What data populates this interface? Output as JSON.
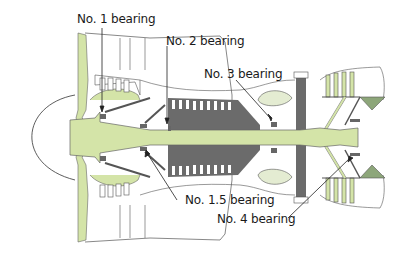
{
  "diagram": {
    "colors": {
      "rotor_green": "#d4e4a8",
      "compressor_gray": "#6b6b6b",
      "outline": "#333333",
      "background": "#ffffff"
    },
    "labels": [
      {
        "id": "no1",
        "text": "No. 1 bearing"
      },
      {
        "id": "no2",
        "text": "No. 2 bearing"
      },
      {
        "id": "no3",
        "text": "No. 3 bearing"
      },
      {
        "id": "no15",
        "text": "No. 1.5 bearing"
      },
      {
        "id": "no4",
        "text": "No. 4 bearing"
      }
    ]
  }
}
